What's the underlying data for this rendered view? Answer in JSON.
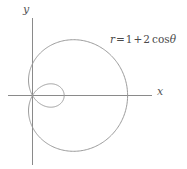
{
  "figure": {
    "background_color": "#ffffff",
    "line_color": "#808080",
    "axis_color": "#808080",
    "text_color": "#4a4a4a"
  },
  "axes": {
    "x_label": "x",
    "y_label": "y",
    "origin_px": {
      "x": 32,
      "y": 95
    },
    "x_axis_extent_px": {
      "from": 8,
      "to": 152
    },
    "y_axis_extent_px": {
      "from": 18,
      "to": 165
    },
    "pixels_per_unit": 31.7
  },
  "equation": {
    "full_text": "r = 1 + 2 cos θ",
    "lhs": "r",
    "equals": "=",
    "constant": "1",
    "plus": "+",
    "coefficient": "2",
    "function": "cos",
    "variable": "θ"
  },
  "chart_data": {
    "type": "line",
    "plot_kind": "polar",
    "title": "",
    "subtitle": "",
    "xlabel": "x",
    "ylabel": "y",
    "grid": false,
    "legend": "none",
    "annotations": [
      {
        "text": "r = 1 + 2 cos θ",
        "x_px": 110,
        "y_px": 33
      }
    ],
    "equation": "r = 1 + 2*cos(theta)",
    "curve_name": "limacon with inner loop",
    "a": 1,
    "b": 2,
    "theta_range_deg": [
      0,
      360
    ],
    "xlim": [
      -2.8,
      3.8
    ],
    "ylim": [
      -2.0,
      2.0
    ],
    "key_points": [
      {
        "theta_deg": 0,
        "r": 3,
        "x": 3,
        "y": 0,
        "note": "outer loop rightmost"
      },
      {
        "theta_deg": 60,
        "r": 2,
        "x": 1,
        "y": 1.732
      },
      {
        "theta_deg": 90,
        "r": 1,
        "x": 0,
        "y": 1
      },
      {
        "theta_deg": 120,
        "r": 0,
        "x": 0,
        "y": 0,
        "note": "passes through pole"
      },
      {
        "theta_deg": 180,
        "r": -1,
        "x": 1,
        "y": 0,
        "note": "inner loop tip"
      },
      {
        "theta_deg": 240,
        "r": 0,
        "x": 0,
        "y": 0,
        "note": "passes through pole"
      },
      {
        "theta_deg": 270,
        "r": 1,
        "x": 0,
        "y": -1
      },
      {
        "theta_deg": 300,
        "r": 2,
        "x": 1,
        "y": -1.732
      },
      {
        "theta_deg": 360,
        "r": 3,
        "x": 3,
        "y": 0
      }
    ],
    "outer_loop": {
      "theta_range_deg": [
        -120,
        120
      ],
      "max_radius": 3,
      "leftmost_x": -0.125,
      "top_y": 2.05,
      "bottom_y": -2.05
    },
    "inner_loop": {
      "theta_range_deg": [
        120,
        240
      ],
      "max_radius": 1,
      "tip_x": 1.0
    }
  }
}
